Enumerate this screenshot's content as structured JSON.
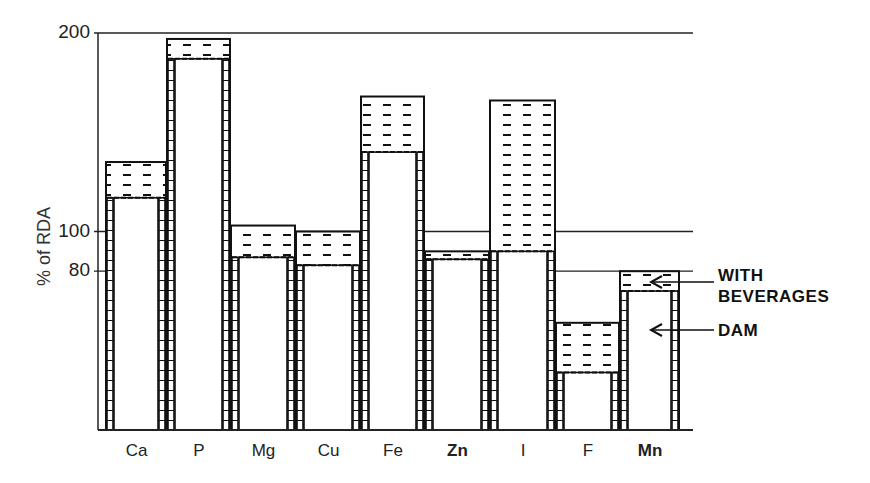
{
  "chart_data": {
    "type": "bar",
    "title": "",
    "xlabel": "",
    "ylabel": "% of RDA",
    "ylim": [
      0,
      200
    ],
    "yticks": [
      80,
      100,
      200
    ],
    "grid": "horizontal lines at 80, 100, 200",
    "categories": [
      "Ca",
      "P",
      "Mg",
      "Cu",
      "Fe",
      "Zn",
      "I",
      "F",
      "Mn"
    ],
    "series": [
      {
        "name": "DAM",
        "values": [
          117,
          187,
          87,
          83,
          140,
          86,
          90,
          29,
          70
        ]
      },
      {
        "name": "WITH BEVERAGES",
        "values": [
          135,
          197,
          103,
          100,
          168,
          90,
          166,
          54,
          80
        ]
      }
    ],
    "annotations": [
      {
        "text": "WITH BEVERAGES",
        "points_to": "hatched top portion of Mn bar"
      },
      {
        "text": "DAM",
        "points_to": "white inner portion of Mn bar"
      }
    ],
    "legend_position": "right, as arrow annotations"
  },
  "labels": {
    "ylabel": "% of RDA",
    "ticks": [
      "200",
      "100",
      "80"
    ],
    "annot_with_line1": "WITH",
    "annot_with_line2": "BEVERAGES",
    "annot_dam": "DAM"
  }
}
